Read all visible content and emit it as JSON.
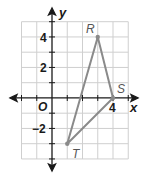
{
  "graph": {
    "axes": {
      "x_label": "x",
      "y_label": "y",
      "origin_label": "O",
      "x_tick_labels": [
        {
          "value": 4,
          "text": "4"
        }
      ],
      "y_tick_labels": [
        {
          "value": 4,
          "text": "4"
        },
        {
          "value": 2,
          "text": "2"
        },
        {
          "value": -2,
          "text": "−2"
        }
      ],
      "x_range": [
        -2,
        5
      ],
      "y_range": [
        -4,
        5
      ]
    },
    "points": [
      {
        "name": "R",
        "x": 3,
        "y": 4
      },
      {
        "name": "S",
        "x": 4,
        "y": 0
      },
      {
        "name": "T",
        "x": 1,
        "y": -3
      }
    ],
    "triangle": [
      "R",
      "S",
      "T"
    ],
    "colors": {
      "grid": "#cfcfcf",
      "axis": "#1a1a1a",
      "triangle": "#8a8a8a",
      "label": "#555555"
    }
  }
}
